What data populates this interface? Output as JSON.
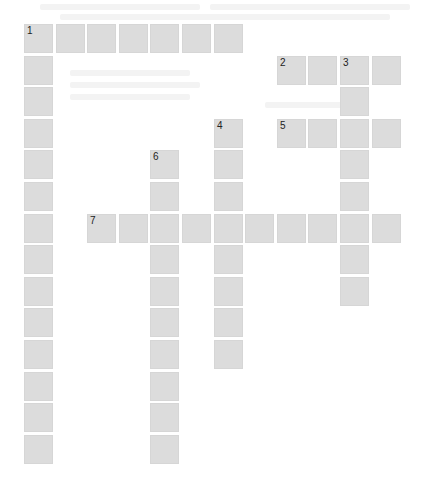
{
  "puzzle": {
    "type": "crossword",
    "cell_color": "#dcdcdc",
    "number_color": "#222222",
    "background_color": "#ffffff",
    "grid": {
      "origin_x": 24,
      "origin_y": 24,
      "pitch": 31.6,
      "cell_size": 29,
      "columns": 12,
      "rows": 14
    },
    "entries": [
      {
        "number": "1",
        "direction": "across",
        "row": 0,
        "col": 0,
        "length": 7
      },
      {
        "number": "1",
        "direction": "down",
        "row": 0,
        "col": 0,
        "length": 14
      },
      {
        "number": "2",
        "direction": "across",
        "row": 1,
        "col": 8,
        "length": 4
      },
      {
        "number": "3",
        "direction": "down",
        "row": 1,
        "col": 10,
        "length": 8
      },
      {
        "number": "4",
        "direction": "down",
        "row": 3,
        "col": 6,
        "length": 8
      },
      {
        "number": "5",
        "direction": "across",
        "row": 3,
        "col": 8,
        "length": 4
      },
      {
        "number": "6",
        "direction": "down",
        "row": 4,
        "col": 4,
        "length": 10
      },
      {
        "number": "7",
        "direction": "across",
        "row": 6,
        "col": 2,
        "length": 10
      }
    ]
  }
}
